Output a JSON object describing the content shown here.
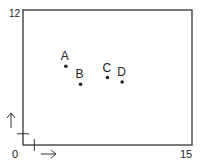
{
  "chart_data": {
    "type": "scatter",
    "title": "",
    "xlabel": "",
    "ylabel": "",
    "xlim": [
      0,
      15
    ],
    "ylim": [
      0,
      12
    ],
    "origin_label": "0",
    "x_max_label": "15",
    "y_max_label": "12",
    "grid": false,
    "unit_ticks": {
      "x": 1,
      "y": 1
    },
    "direction_arrows": {
      "x": "right",
      "y": "up"
    },
    "points": [
      {
        "label": "A",
        "x": 3.8,
        "y": 7.0
      },
      {
        "label": "B",
        "x": 5.1,
        "y": 5.4
      },
      {
        "label": "C",
        "x": 7.5,
        "y": 6.0
      },
      {
        "label": "D",
        "x": 8.8,
        "y": 5.6
      }
    ]
  },
  "colors": {
    "stroke": "#333333",
    "text": "#222222",
    "background": "#ffffff"
  }
}
